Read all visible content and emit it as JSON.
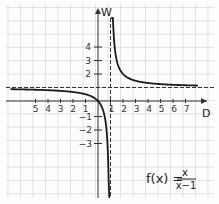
{
  "chart_data": {
    "type": "line",
    "formula": {
      "lhs": "f(x) =",
      "numerator": "x",
      "denominator": "x−1"
    },
    "xlabel": "D",
    "ylabel": "W",
    "x_tick_labels_left": [
      "5",
      "4",
      "3",
      "2",
      "1"
    ],
    "x_tick_labels_right": [
      "1",
      "2",
      "3",
      "4",
      "5",
      "6",
      "7"
    ],
    "y_tick_labels_positive": [
      "2",
      "3",
      "4"
    ],
    "y_tick_labels_negative": [
      "−1",
      "−2",
      "−3"
    ],
    "xlim": [
      -7,
      8
    ],
    "ylim": [
      -7,
      7
    ],
    "grid": true,
    "asymptotes": {
      "vertical": 1,
      "horizontal": 1
    },
    "series": [
      {
        "name": "f(x) left branch",
        "x": [
          -6.5,
          -5,
          -4,
          -3,
          -2,
          -1,
          -0.5,
          0,
          0.3,
          0.5,
          0.7,
          0.85
        ],
        "y": [
          0.87,
          0.83,
          0.8,
          0.75,
          0.67,
          0.5,
          0.33,
          0,
          -0.43,
          -1,
          -2.33,
          -5.67
        ]
      },
      {
        "name": "f(x) right branch",
        "x": [
          1.15,
          1.25,
          1.5,
          2,
          3,
          4,
          5,
          6,
          7,
          7.5
        ],
        "y": [
          7.67,
          5,
          3,
          2,
          1.5,
          1.33,
          1.25,
          1.2,
          1.17,
          1.15
        ]
      }
    ]
  }
}
